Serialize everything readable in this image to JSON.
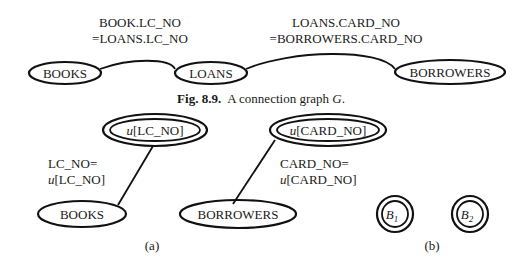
{
  "figure_top": {
    "edge_labels": [
      {
        "line1": "BOOK.LC_NO",
        "line2": "=LOANS.LC_NO"
      },
      {
        "line1": "LOANS.CARD_NO",
        "line2": "=BORROWERS.CARD_NO"
      }
    ],
    "nodes": [
      "BOOKS",
      "LOANS",
      "BORROWERS"
    ],
    "caption": {
      "prefix": "Fig. 8.9.",
      "text": "A connection graph ",
      "var": "G",
      "suffix": "."
    }
  },
  "figure_a": {
    "tuple_nodes": [
      {
        "u": "u",
        "attr": "[LC_NO]"
      },
      {
        "u": "u",
        "attr": "[CARD_NO]"
      }
    ],
    "edge_labels": [
      {
        "line1": "LC_NO=",
        "u": "u",
        "line2": "[LC_NO]"
      },
      {
        "line1": "CARD_NO=",
        "u": "u",
        "line2": "[CARD_NO]"
      }
    ],
    "relation_nodes": [
      "BOOKS",
      "BORROWERS"
    ],
    "label": "(a)"
  },
  "figure_b": {
    "nodes": [
      {
        "name": "B",
        "sub": "1"
      },
      {
        "name": "B",
        "sub": "2"
      }
    ],
    "label": "(b)"
  }
}
